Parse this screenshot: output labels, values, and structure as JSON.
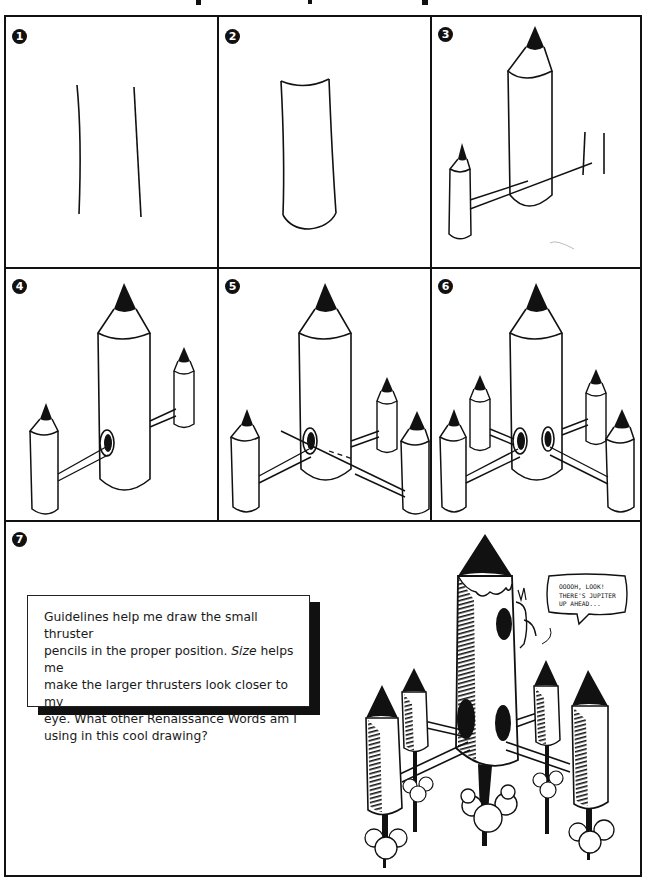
{
  "page": {
    "title_fragment_visible": true,
    "border_color": "#111111",
    "background": "#ffffff"
  },
  "steps": [
    {
      "number": "1",
      "description": "two slightly curved vertical lines"
    },
    {
      "number": "2",
      "description": "cylinder body with curved top and bottom"
    },
    {
      "number": "3",
      "description": "large pencil with small pencil and guidelines"
    },
    {
      "number": "4",
      "description": "rocket pencil with two thrusters and hole"
    },
    {
      "number": "5",
      "description": "rocket with three thrusters and guidelines"
    },
    {
      "number": "6",
      "description": "rocket with four thrusters"
    },
    {
      "number": "7",
      "description": "final shaded rocket pencil drawing with character"
    }
  ],
  "caption": {
    "line1": "Guidelines help me draw the small thruster",
    "line2_pre": "pencils in the proper position. ",
    "line2_em": "Size",
    "line2_post": " helps me",
    "line3": "make the larger thrusters look closer to my",
    "line4": "eye. What other Renaissance Words am I",
    "line5": "using in this cool drawing?"
  },
  "speech_bubble": {
    "line1": "Ooooh, Look!",
    "line2": "There's Jupiter",
    "line3": "up ahead..."
  }
}
